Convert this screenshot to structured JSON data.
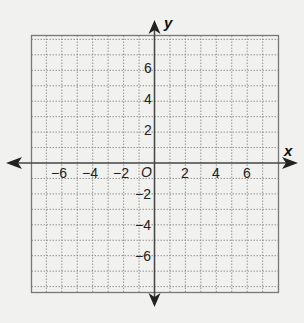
{
  "graph": {
    "title": "Coordinate plane",
    "x_axis_label": "x",
    "y_axis_label": "y",
    "origin_label": "O",
    "x_range": [
      -8,
      8
    ],
    "y_range": [
      -8,
      8
    ],
    "grid_step": 1,
    "x_tick_labels": [
      "−6",
      "−4",
      "−2",
      "2",
      "4",
      "6"
    ],
    "y_tick_labels": [
      "6",
      "4",
      "2",
      "−2",
      "−4",
      "−6"
    ],
    "colors": {
      "background": "#f1f1ef",
      "grid": "#8a8a8a",
      "axis": "#444444",
      "border": "#777777"
    }
  }
}
